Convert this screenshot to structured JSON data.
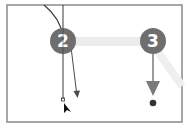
{
  "diagram": {
    "colors": {
      "frame": "#8a8a8a",
      "step_circle": "#6e6e6e",
      "step_text": "#ffffff",
      "path_line": "#3a3a3a",
      "direction_arrow": "#5a5a5a",
      "highlight_band": "#ececec",
      "endpoint_dot": "#333333",
      "cursor": "#111111"
    },
    "steps": [
      {
        "label": "2",
        "cx": 63,
        "cy": 41
      },
      {
        "label": "3",
        "cx": 153,
        "cy": 41
      }
    ]
  }
}
